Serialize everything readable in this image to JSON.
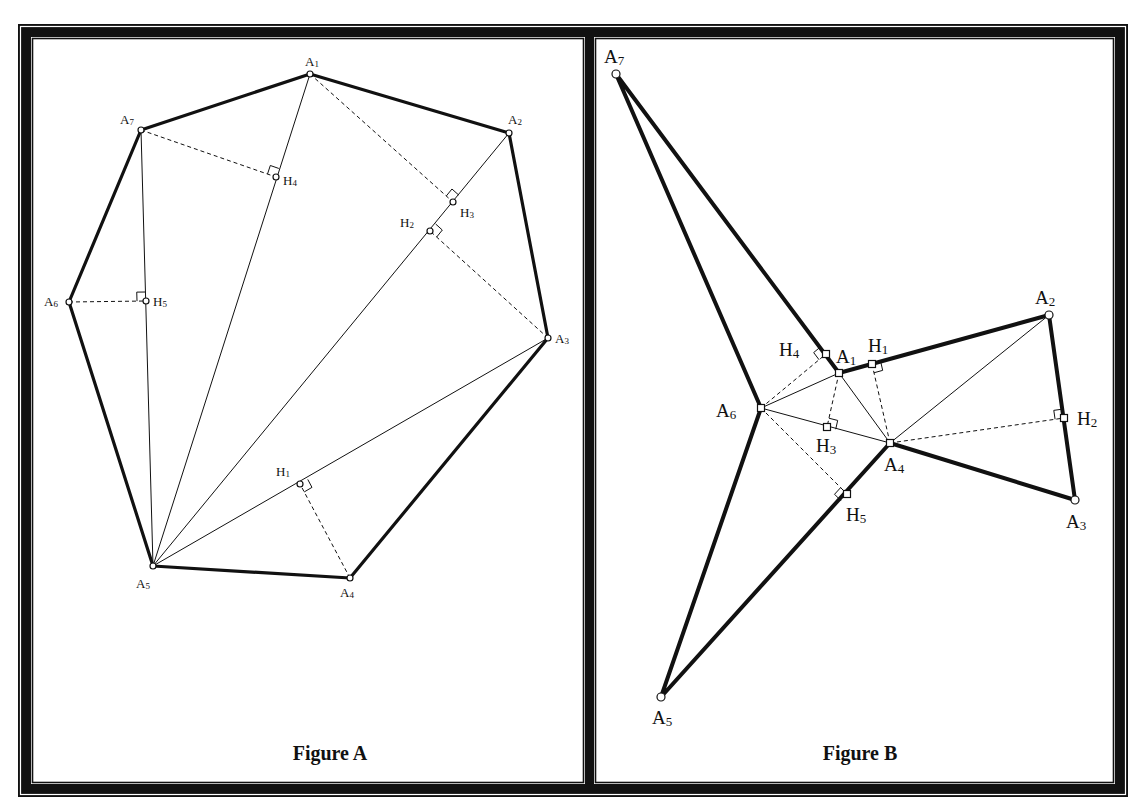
{
  "figures": [
    {
      "id": "A",
      "caption": "Figure A",
      "caption_pos": [
        330,
        760
      ],
      "label_class": "a",
      "points": {
        "A1": {
          "x": 310,
          "y": 74,
          "label": "A",
          "sub": "1",
          "lx": 305,
          "ly": 66
        },
        "A2": {
          "x": 509,
          "y": 133,
          "label": "A",
          "sub": "2",
          "lx": 508,
          "ly": 124
        },
        "A3": {
          "x": 548,
          "y": 338,
          "label": "A",
          "sub": "3",
          "lx": 555,
          "ly": 343
        },
        "A4": {
          "x": 350,
          "y": 578,
          "label": "A",
          "sub": "4",
          "lx": 340,
          "ly": 597
        },
        "A5": {
          "x": 153,
          "y": 566,
          "label": "A",
          "sub": "5",
          "lx": 136,
          "ly": 588
        },
        "A6": {
          "x": 69,
          "y": 302,
          "label": "A",
          "sub": "6",
          "lx": 44,
          "ly": 306
        },
        "A7": {
          "x": 141,
          "y": 130,
          "label": "A",
          "sub": "7",
          "lx": 120,
          "ly": 124
        },
        "H1": {
          "x": 300,
          "y": 484,
          "label": "H",
          "sub": "1",
          "lx": 276,
          "ly": 476
        },
        "H2": {
          "x": 430,
          "y": 231,
          "label": "H",
          "sub": "2",
          "lx": 400,
          "ly": 227
        },
        "H3": {
          "x": 453,
          "y": 202,
          "label": "H",
          "sub": "3",
          "lx": 460,
          "ly": 217
        },
        "H4": {
          "x": 276,
          "y": 177,
          "label": "H",
          "sub": "4",
          "lx": 283,
          "ly": 185
        },
        "H5": {
          "x": 146,
          "y": 301,
          "label": "H",
          "sub": "5",
          "lx": 153,
          "ly": 306
        }
      },
      "polygon": [
        "A1",
        "A2",
        "A3",
        "A4",
        "A5",
        "A6",
        "A7"
      ],
      "thin_lines": [
        [
          "A5",
          "A1"
        ],
        [
          "A5",
          "A2"
        ],
        [
          "A5",
          "A3"
        ],
        [
          "A5",
          "A7"
        ]
      ],
      "dashed_lines": [
        [
          "A4",
          "H1"
        ],
        [
          "A3",
          "H2"
        ],
        [
          "A1",
          "H3"
        ],
        [
          "A7",
          "H4"
        ],
        [
          "A6",
          "H5"
        ]
      ],
      "right_angles": [
        {
          "at": "H1",
          "toward": "A3",
          "foot": "A4"
        },
        {
          "at": "H2",
          "toward": "A2",
          "foot": "A3"
        },
        {
          "at": "H3",
          "toward": "A2",
          "foot": "A1"
        },
        {
          "at": "H4",
          "toward": "A1",
          "foot": "A7"
        },
        {
          "at": "H5",
          "toward": "A7",
          "foot": "A6"
        }
      ]
    },
    {
      "id": "B",
      "caption": "Figure B",
      "caption_pos": [
        860,
        760
      ],
      "label_class": "b",
      "points": {
        "A1": {
          "x": 839,
          "y": 373,
          "label": "A",
          "sub": "1",
          "lx": 836,
          "ly": 363
        },
        "A2": {
          "x": 1049,
          "y": 315,
          "label": "A",
          "sub": "2",
          "lx": 1035,
          "ly": 304
        },
        "A3": {
          "x": 1075,
          "y": 500,
          "label": "A",
          "sub": "3",
          "lx": 1066,
          "ly": 528
        },
        "A4": {
          "x": 890,
          "y": 443,
          "label": "A",
          "sub": "4",
          "lx": 884,
          "ly": 471
        },
        "A5": {
          "x": 661,
          "y": 697,
          "label": "A",
          "sub": "5",
          "lx": 652,
          "ly": 724
        },
        "A6": {
          "x": 761,
          "y": 408,
          "label": "A",
          "sub": "6",
          "lx": 716,
          "ly": 417
        },
        "A7": {
          "x": 616,
          "y": 74,
          "label": "A",
          "sub": "7",
          "lx": 604,
          "ly": 63
        },
        "H1": {
          "x": 872,
          "y": 364,
          "label": "H",
          "sub": "1",
          "lx": 868,
          "ly": 352
        },
        "H2": {
          "x": 1064,
          "y": 418,
          "label": "H",
          "sub": "2",
          "lx": 1077,
          "ly": 425
        },
        "H3": {
          "x": 827,
          "y": 427,
          "label": "H",
          "sub": "3",
          "lx": 816,
          "ly": 452
        },
        "H4": {
          "x": 826,
          "y": 354,
          "label": "H",
          "sub": "4",
          "lx": 779,
          "ly": 356
        },
        "H5": {
          "x": 847,
          "y": 494,
          "label": "H",
          "sub": "5",
          "lx": 846,
          "ly": 521
        }
      },
      "polygon": [
        "A1",
        "A2",
        "A3",
        "A4",
        "A5",
        "A6",
        "A7"
      ],
      "thin_lines": [
        [
          "A4",
          "A2"
        ],
        [
          "A4",
          "A1"
        ],
        [
          "A4",
          "A6"
        ],
        [
          "A6",
          "A1"
        ]
      ],
      "dashed_lines": [
        [
          "A4",
          "H1"
        ],
        [
          "A4",
          "H2"
        ],
        [
          "A1",
          "H3"
        ],
        [
          "A6",
          "H4"
        ],
        [
          "A6",
          "H5"
        ]
      ],
      "right_angles": [
        {
          "at": "H1",
          "toward": "A2",
          "foot": "A4"
        },
        {
          "at": "H2",
          "toward": "A2",
          "foot": "A4"
        },
        {
          "at": "H3",
          "toward": "A4",
          "foot": "A1"
        },
        {
          "at": "H4",
          "toward": "A7",
          "foot": "A6"
        },
        {
          "at": "H5",
          "toward": "A5",
          "foot": "A6"
        }
      ]
    }
  ],
  "frame": {
    "outer": [
      18,
      24,
      1128,
      797
    ],
    "panels": [
      [
        34,
        40,
        582,
        781
      ],
      [
        597,
        40,
        1112,
        781
      ]
    ],
    "color": "#111111"
  },
  "style": {
    "stroke": "#111111",
    "polygon_width_a": 3.2,
    "polygon_width_b": 4,
    "thin_width": 1,
    "dash": "4,3"
  }
}
